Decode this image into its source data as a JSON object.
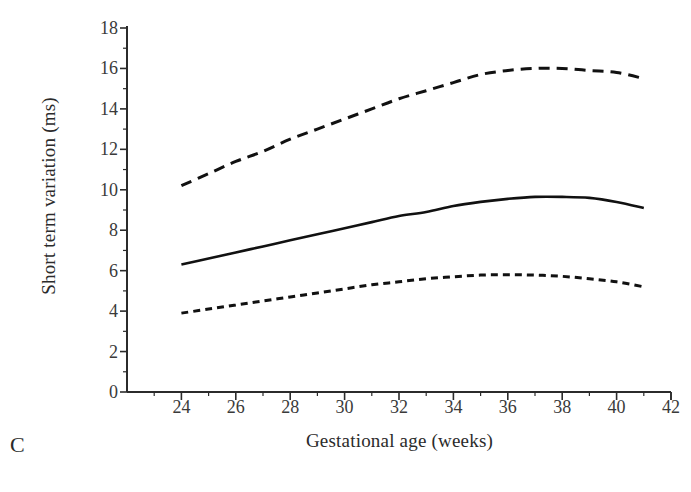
{
  "panel": {
    "label": "C"
  },
  "chart_data": {
    "type": "line",
    "title": "",
    "xlabel": "Gestational age (weeks)",
    "ylabel": "Short term variation (ms)",
    "xlim": [
      22,
      42
    ],
    "ylim": [
      0,
      18
    ],
    "xticks": [
      24,
      26,
      28,
      30,
      32,
      34,
      36,
      38,
      40,
      42
    ],
    "yticks": [
      0,
      2,
      4,
      6,
      8,
      10,
      12,
      14,
      16,
      18
    ],
    "minor_ticks": true,
    "grid": false,
    "legend": "none",
    "x": [
      24,
      25,
      26,
      27,
      28,
      29,
      30,
      31,
      32,
      33,
      34,
      35,
      36,
      37,
      38,
      39,
      40,
      41
    ],
    "series": [
      {
        "name": "upper limit",
        "style": "dashed-long",
        "values": [
          10.2,
          10.8,
          11.4,
          11.9,
          12.5,
          13.0,
          13.5,
          14.0,
          14.5,
          14.9,
          15.3,
          15.7,
          15.9,
          16.0,
          16.0,
          15.9,
          15.8,
          15.5
        ]
      },
      {
        "name": "median",
        "style": "solid",
        "values": [
          6.3,
          6.6,
          6.9,
          7.2,
          7.5,
          7.8,
          8.1,
          8.4,
          8.7,
          8.9,
          9.2,
          9.4,
          9.55,
          9.65,
          9.65,
          9.6,
          9.4,
          9.1
        ]
      },
      {
        "name": "lower limit",
        "style": "dashed-short",
        "values": [
          3.9,
          4.1,
          4.3,
          4.5,
          4.7,
          4.9,
          5.1,
          5.3,
          5.45,
          5.6,
          5.7,
          5.78,
          5.8,
          5.78,
          5.72,
          5.6,
          5.45,
          5.2
        ]
      }
    ]
  },
  "colors": {
    "axis": "#2b2b2b",
    "curve": "#111111",
    "background": "#ffffff"
  }
}
